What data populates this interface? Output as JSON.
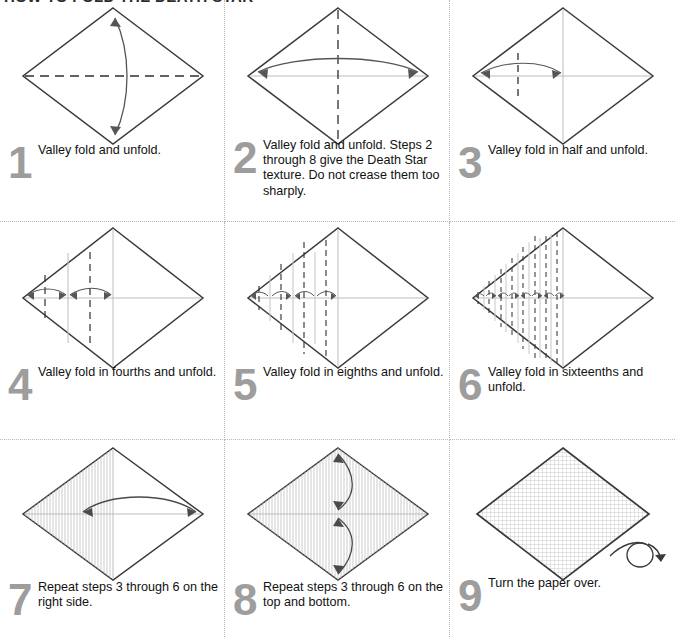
{
  "document": {
    "title": "HOW TO FOLD THE DEATH STAR"
  },
  "colors": {
    "paper_edge": "#3a3a3a",
    "crease_existing": "#b9b9b9",
    "fold_line": "#3a3a3a",
    "arrow": "#4a4a4a",
    "step_number": "#9d9d9d",
    "divider": "#b8b8b8",
    "text": "#111111",
    "background": "#ffffff"
  },
  "steps": [
    {
      "number": "1",
      "text": "Valley fold and unfold.",
      "diagram": "diamond-horizontal-dashed-with-vertical-double-arrow"
    },
    {
      "number": "2",
      "text": "Valley fold and unfold. Steps 2 through 8 give the Death Star texture. Do not crease them too sharply.",
      "diagram": "diamond-vertical-dashed-with-horizontal-double-arrow"
    },
    {
      "number": "3",
      "text": "Valley fold in half and unfold.",
      "diagram": "diamond-quarter-dashed-left-with-arrow"
    },
    {
      "number": "4",
      "text": "Valley fold in fourths and unfold.",
      "diagram": "diamond-eighths-dashed-left-two-arrows"
    },
    {
      "number": "5",
      "text": "Valley fold in eighths and unfold.",
      "diagram": "diamond-sixteenths-dashed-left-four-arrows"
    },
    {
      "number": "6",
      "text": "Valley fold in sixteenths and unfold.",
      "diagram": "diamond-thirtyseconds-dashed-left-eight-arrows"
    },
    {
      "number": "7",
      "text": "Repeat steps 3 through 6 on the right side.",
      "diagram": "diamond-left-half-pleated-with-repeat-arrow-right"
    },
    {
      "number": "8",
      "text": "Repeat steps 3 through 6 on the top and bottom.",
      "diagram": "diamond-fully-pleated-with-two-vertical-repeat-arrows"
    },
    {
      "number": "9",
      "text": "Turn the paper over.",
      "diagram": "diamond-grid-texture-with-turn-over-arrow"
    }
  ]
}
